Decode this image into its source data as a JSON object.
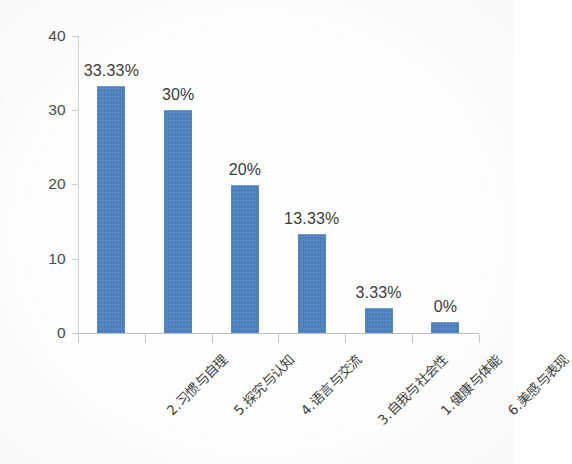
{
  "chart_data": {
    "type": "bar",
    "title": "",
    "subtitle": "",
    "xlabel": "",
    "ylabel": "",
    "ylim": [
      0,
      40
    ],
    "yticks": [
      0,
      10,
      20,
      30,
      40
    ],
    "grid": false,
    "legend": "none",
    "orientation": "vertical",
    "bar_color": "#4a7ebc",
    "categories": [
      "2.习惯与自理",
      "5.探究与认知",
      "4.语言与交流",
      "3.自我与社会性",
      "1.健康与体能",
      "6.美感与表现"
    ],
    "values": [
      33.33,
      30,
      20,
      13.33,
      3.33,
      1.5
    ],
    "data_labels": [
      "33.33%",
      "30%",
      "20%",
      "13.33%",
      "3.33%",
      "0%"
    ]
  },
  "axes": {
    "y_tick_labels": [
      "40",
      "30",
      "20",
      "10",
      "0"
    ],
    "y_tick_values": [
      40,
      30,
      20,
      10,
      0
    ]
  }
}
